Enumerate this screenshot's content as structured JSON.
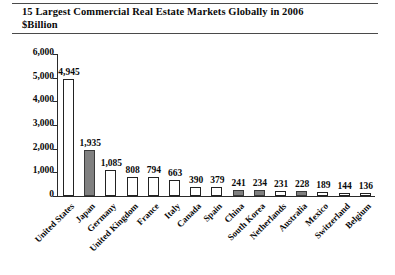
{
  "chart_data": {
    "type": "bar",
    "title": "15 Largest Commercial Real Estate Markets Globally in 2006",
    "subtitle": "$Billion",
    "xlabel": "",
    "ylabel": "",
    "ylim": [
      0,
      6000
    ],
    "yticks": [
      "0",
      "1,000",
      "2,000",
      "3,000",
      "4,000",
      "5,000",
      "6,000"
    ],
    "ytick_values": [
      0,
      1000,
      2000,
      3000,
      4000,
      5000,
      6000
    ],
    "grid": false,
    "legend": "none",
    "categories": [
      "United States",
      "Japan",
      "Germany",
      "United Kingdom",
      "France",
      "Italy",
      "Canada",
      "Spain",
      "China",
      "South Korea",
      "Netherlands",
      "Australia",
      "Mexico",
      "Switzerland",
      "Belgium"
    ],
    "values": [
      4945,
      1935,
      1085,
      808,
      794,
      663,
      390,
      379,
      241,
      234,
      231,
      228,
      189,
      144,
      136
    ],
    "value_labels": [
      "4,945",
      "1,935",
      "1,085",
      "808",
      "794",
      "663",
      "390",
      "379",
      "241",
      "234",
      "231",
      "228",
      "189",
      "144",
      "136"
    ],
    "bar_fill": [
      "white",
      "gray",
      "white",
      "white",
      "white",
      "white",
      "white",
      "white",
      "gray",
      "gray",
      "white",
      "gray",
      "white",
      "white",
      "white"
    ],
    "colors": {
      "bar_white": "#ffffff",
      "bar_gray": "#808080",
      "bar_outline": "#222222",
      "axis": "#2a2a2a",
      "text": "#0a0a0a",
      "rule": "#4a4a4a",
      "background": "#ffffff"
    }
  }
}
